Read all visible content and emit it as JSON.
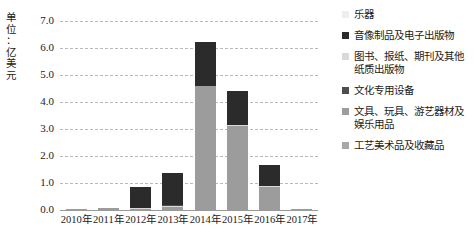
{
  "chart_data": {
    "type": "bar",
    "stacked": true,
    "title": "",
    "xlabel": "",
    "ylabel": "单位：亿美元",
    "ylim": [
      0.0,
      7.0
    ],
    "ytick_labels": [
      "0.0",
      "1.0",
      "2.0",
      "3.0",
      "4.0",
      "5.0",
      "6.0",
      "7.0"
    ],
    "ytick_values": [
      0.0,
      1.0,
      2.0,
      3.0,
      4.0,
      5.0,
      6.0,
      7.0
    ],
    "grid": "horizontal-dashed",
    "legend_position": "right",
    "categories": [
      "2010年",
      "2011年",
      "2012年",
      "2013年",
      "2014年",
      "2015年",
      "2016年",
      "2017年"
    ],
    "series": [
      {
        "name": "乐器",
        "color": "#eeeeee",
        "values": [
          0.0,
          0.0,
          0.0,
          0.0,
          0.0,
          0.0,
          0.0,
          0.0
        ]
      },
      {
        "name": "音像制品及电子出版物",
        "color": "#2b2b2b",
        "values": [
          0.0,
          0.0,
          0.78,
          1.18,
          1.62,
          1.28,
          0.75,
          0.0
        ]
      },
      {
        "name": "图书、报纸、期刊及其他纸质出版物",
        "color": "#d9d9d9",
        "values": [
          0.0,
          0.0,
          0.04,
          0.06,
          0.03,
          0.03,
          0.05,
          0.0
        ]
      },
      {
        "name": "文化专用设备",
        "color": "#4d4d4d",
        "values": [
          0.0,
          0.0,
          0.0,
          0.02,
          0.0,
          0.0,
          0.0,
          0.0
        ]
      },
      {
        "name": "文具、玩具、游艺器材及娱乐用品",
        "color": "#9c9c9c",
        "values": [
          0.04,
          0.06,
          0.05,
          0.1,
          4.58,
          3.11,
          0.85,
          0.03
        ]
      },
      {
        "name": "工艺美术品及收藏品",
        "color": "#a8a8a8",
        "values": [
          0.0,
          0.0,
          0.0,
          0.0,
          0.0,
          0.0,
          0.0,
          0.0
        ]
      }
    ],
    "totals": [
      0.04,
      0.06,
      0.87,
      1.36,
      6.23,
      4.42,
      1.65,
      0.03
    ],
    "bar_segments": [
      {
        "category": "2010年",
        "segments": [
          {
            "series": "文具、玩具、游艺器材及娱乐用品",
            "from": 0.0,
            "to": 0.04,
            "color": "#9c9c9c"
          }
        ]
      },
      {
        "category": "2011年",
        "segments": [
          {
            "series": "文具、玩具、游艺器材及娱乐用品",
            "from": 0.0,
            "to": 0.06,
            "color": "#9c9c9c"
          }
        ]
      },
      {
        "category": "2012年",
        "segments": [
          {
            "series": "文具、玩具、游艺器材及娱乐用品",
            "from": 0.0,
            "to": 0.05,
            "color": "#9c9c9c"
          },
          {
            "series": "图书、报纸、期刊及其他纸质出版物",
            "from": 0.05,
            "to": 0.09,
            "color": "#d9d9d9"
          },
          {
            "series": "音像制品及电子出版物",
            "from": 0.09,
            "to": 0.87,
            "color": "#2b2b2b"
          }
        ]
      },
      {
        "category": "2013年",
        "segments": [
          {
            "series": "文具、玩具、游艺器材及娱乐用品",
            "from": 0.0,
            "to": 0.1,
            "color": "#9c9c9c"
          },
          {
            "series": "图书、报纸、期刊及其他纸质出版物",
            "from": 0.1,
            "to": 0.16,
            "color": "#d9d9d9"
          },
          {
            "series": "文化专用设备",
            "from": 0.16,
            "to": 0.18,
            "color": "#4d4d4d"
          },
          {
            "series": "音像制品及电子出版物",
            "from": 0.18,
            "to": 1.36,
            "color": "#2b2b2b"
          }
        ]
      },
      {
        "category": "2014年",
        "segments": [
          {
            "series": "文具、玩具、游艺器材及娱乐用品",
            "from": 0.0,
            "to": 4.58,
            "color": "#9c9c9c"
          },
          {
            "series": "图书、报纸、期刊及其他纸质出版物",
            "from": 4.58,
            "to": 4.61,
            "color": "#d9d9d9"
          },
          {
            "series": "音像制品及电子出版物",
            "from": 4.61,
            "to": 6.23,
            "color": "#2b2b2b"
          }
        ]
      },
      {
        "category": "2015年",
        "segments": [
          {
            "series": "文具、玩具、游艺器材及娱乐用品",
            "from": 0.0,
            "to": 3.11,
            "color": "#9c9c9c"
          },
          {
            "series": "图书、报纸、期刊及其他纸质出版物",
            "from": 3.11,
            "to": 3.14,
            "color": "#d9d9d9"
          },
          {
            "series": "音像制品及电子出版物",
            "from": 3.14,
            "to": 4.42,
            "color": "#2b2b2b"
          }
        ]
      },
      {
        "category": "2016年",
        "segments": [
          {
            "series": "文具、玩具、游艺器材及娱乐用品",
            "from": 0.0,
            "to": 0.85,
            "color": "#9c9c9c"
          },
          {
            "series": "图书、报纸、期刊及其他纸质出版物",
            "from": 0.85,
            "to": 0.9,
            "color": "#d9d9d9"
          },
          {
            "series": "音像制品及电子出版物",
            "from": 0.9,
            "to": 1.65,
            "color": "#2b2b2b"
          }
        ]
      },
      {
        "category": "2017年",
        "segments": [
          {
            "series": "文具、玩具、游艺器材及娱乐用品",
            "from": 0.0,
            "to": 0.03,
            "color": "#9c9c9c"
          }
        ]
      }
    ]
  },
  "legend": {
    "items": [
      {
        "label": "乐器",
        "color": "#eeeeee"
      },
      {
        "label": "音像制品及电子出版物",
        "color": "#2b2b2b"
      },
      {
        "label": "图书、报纸、期刊及其他纸质出版物",
        "color": "#d9d9d9"
      },
      {
        "label": "文化专用设备",
        "color": "#4d4d4d"
      },
      {
        "label": "文具、玩具、游艺器材及娱乐用品",
        "color": "#9c9c9c"
      },
      {
        "label": "工艺美术品及收藏品",
        "color": "#a8a8a8"
      }
    ]
  },
  "axis": {
    "unit_label_chars": [
      "单",
      "位",
      "：",
      "亿",
      "美",
      "元"
    ]
  }
}
